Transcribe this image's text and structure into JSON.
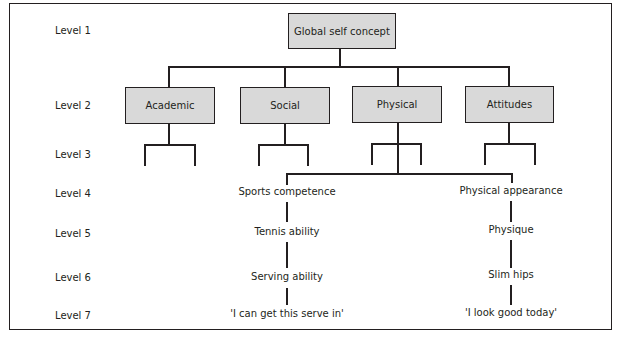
{
  "levels": [
    "Level 1",
    "Level 2",
    "Level 3",
    "Level 4",
    "Level 5",
    "Level 6",
    "Level 7"
  ],
  "level1": {
    "label": "Global self concept"
  },
  "level2": [
    {
      "label": "Academic"
    },
    {
      "label": "Social"
    },
    {
      "label": "Physical"
    },
    {
      "label": "Attitudes"
    }
  ],
  "branches": [
    {
      "parent": "Physical",
      "chain": [
        "Sports competence",
        "Tennis ability",
        "Serving ability",
        "'I can get this serve in'"
      ]
    },
    {
      "parent": "Physical",
      "chain": [
        "Physical appearance",
        "Physique",
        "Slim hips",
        "'I look good today'"
      ]
    }
  ],
  "colors": {
    "box_fill": "#d9d9d9",
    "line": "#231f20",
    "background": "#ffffff"
  }
}
